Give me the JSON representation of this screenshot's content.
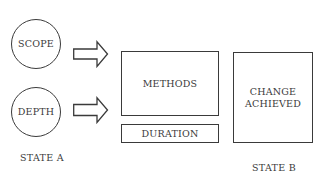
{
  "diagram": {
    "inputs": [
      {
        "id": "scope",
        "label": "SCOPE"
      },
      {
        "id": "depth",
        "label": "DEPTH"
      }
    ],
    "process": {
      "methods": "METHODS",
      "duration": "DURATION"
    },
    "outcome": {
      "line1": "CHANGE",
      "line2": "ACHIEVED"
    },
    "state_labels": {
      "a": "STATE A",
      "b": "STATE B"
    },
    "arrows": [
      {
        "from": "SCOPE",
        "to": "METHODS"
      },
      {
        "from": "DEPTH",
        "to": "METHODS"
      }
    ],
    "colors": {
      "stroke": "#3a3a3a",
      "background": "#ffffff"
    }
  }
}
